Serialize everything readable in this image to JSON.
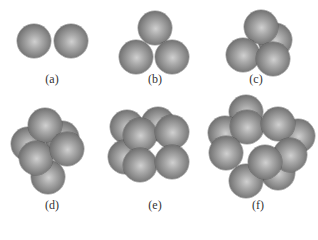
{
  "figure": {
    "sphere_radius": 17,
    "panels": [
      {
        "id": "a",
        "label": "(a)",
        "label_pos": [
          52,
          79
        ],
        "count": 2,
        "spheres": [
          [
            34,
            41
          ],
          [
            71,
            41
          ]
        ]
      },
      {
        "id": "b",
        "label": "(b)",
        "label_pos": [
          155,
          79
        ],
        "count": 3,
        "spheres": [
          [
            155,
            28
          ],
          [
            136,
            57
          ],
          [
            172,
            57
          ]
        ]
      },
      {
        "id": "c",
        "label": "(c)",
        "label_pos": [
          256,
          79
        ],
        "count": 4,
        "spheres": [
          [
            275,
            40
          ],
          [
            261,
            27
          ],
          [
            243,
            55
          ],
          [
            273,
            59
          ]
        ]
      },
      {
        "id": "d",
        "label": "(d)",
        "label_pos": [
          52,
          205
        ],
        "count": 6,
        "spheres": [
          [
            28,
            144
          ],
          [
            62,
            138
          ],
          [
            48,
            177
          ],
          [
            45,
            125
          ],
          [
            36,
            158
          ],
          [
            67,
            149
          ]
        ]
      },
      {
        "id": "e",
        "label": "(e)",
        "label_pos": [
          155,
          205
        ],
        "count": 8,
        "spheres": [
          [
            127,
            127
          ],
          [
            158,
            124
          ],
          [
            125,
            157
          ],
          [
            140,
            135
          ],
          [
            172,
            132
          ],
          [
            140,
            165
          ],
          [
            172,
            162
          ]
        ]
      },
      {
        "id": "f",
        "label": "(f)",
        "label_pos": [
          258,
          205
        ],
        "count": 12,
        "spheres": [
          [
            246,
            112
          ],
          [
            225,
            133
          ],
          [
            298,
            136
          ],
          [
            278,
            173
          ],
          [
            246,
            181
          ],
          [
            247,
            127
          ],
          [
            278,
            124
          ],
          [
            226,
            153
          ],
          [
            290,
            155
          ],
          [
            265,
            162
          ]
        ]
      }
    ]
  }
}
